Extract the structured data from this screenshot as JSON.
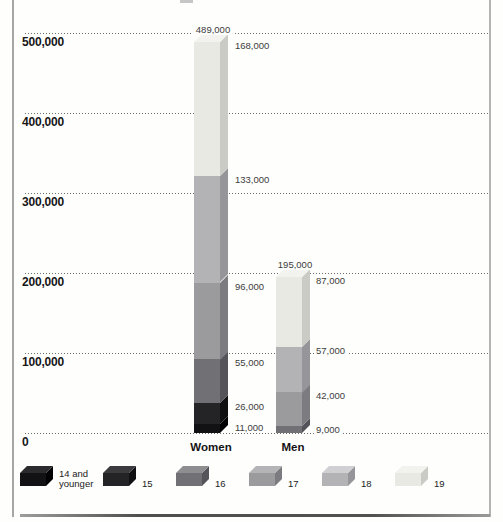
{
  "chart_data": {
    "type": "bar",
    "stacked": true,
    "orientation": "vertical",
    "style": "3d-extruded-grayscale",
    "categories": [
      "Women",
      "Men"
    ],
    "series": [
      {
        "name": "14 and younger",
        "legend_lines": [
          "14 and",
          "younger"
        ],
        "values": [
          11000,
          0
        ],
        "color": "#121214",
        "side_color": "#010103",
        "top_color": "#2b2b2d"
      },
      {
        "name": "15",
        "legend_lines": [
          "15"
        ],
        "values": [
          26000,
          0
        ],
        "color": "#242427",
        "side_color": "#101013",
        "top_color": "#3b3b3e"
      },
      {
        "name": "16",
        "legend_lines": [
          "16"
        ],
        "values": [
          55000,
          9000
        ],
        "color": "#717175",
        "side_color": "#54545a",
        "top_color": "#8e8e91"
      },
      {
        "name": "17",
        "legend_lines": [
          "17"
        ],
        "values": [
          96000,
          42000
        ],
        "color": "#9b9b9e",
        "side_color": "#7c7c80",
        "top_color": "#b4b4b7"
      },
      {
        "name": "18",
        "legend_lines": [
          "18"
        ],
        "values": [
          133000,
          57000
        ],
        "color": "#b3b3b5",
        "side_color": "#96969a",
        "top_color": "#d0d0d2"
      },
      {
        "name": "19",
        "legend_lines": [
          "19"
        ],
        "values": [
          168000,
          87000
        ],
        "color": "#e9e9e4",
        "side_color": "#cbcbc6",
        "top_color": "#f2f2ee"
      }
    ],
    "totals_labels": [
      "489,000",
      "195,000"
    ],
    "segment_value_labels": [
      [
        "11,000",
        "26,000",
        "55,000",
        "96,000",
        "133,000",
        "168,000"
      ],
      [
        "9,000",
        "42,000",
        "57,000",
        "87,000"
      ]
    ],
    "ylim": [
      0,
      500000
    ],
    "ytick_interval": 100000,
    "ytick_labels_bottom_up": [
      "0",
      "100,000",
      "200,000",
      "300,000",
      "400,000",
      "500,000"
    ],
    "grid": "dotted horizontal",
    "legend_position": "bottom",
    "legend_labels": [
      "14 and younger",
      "15",
      "16",
      "17",
      "18",
      "19"
    ]
  }
}
